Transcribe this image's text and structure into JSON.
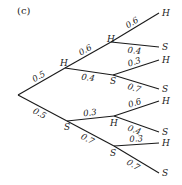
{
  "caption": "(c)",
  "tree": {
    "root": {
      "children": [
        {
          "label": "H",
          "prob": "0.5",
          "children": [
            {
              "label": "H",
              "prob": "0.6",
              "children": [
                {
                  "label": "H",
                  "prob": "0.6"
                },
                {
                  "label": "S",
                  "prob": "0.4"
                }
              ]
            },
            {
              "label": "S",
              "prob": "0.4",
              "children": [
                {
                  "label": "H",
                  "prob": "0.3"
                },
                {
                  "label": "S",
                  "prob": "0.7"
                }
              ]
            }
          ]
        },
        {
          "label": "S",
          "prob": "0.5",
          "children": [
            {
              "label": "H",
              "prob": "0.3",
              "children": [
                {
                  "label": "H",
                  "prob": "0.6"
                },
                {
                  "label": "S",
                  "prob": "0.4"
                }
              ]
            },
            {
              "label": "S",
              "prob": "0.7",
              "children": [
                {
                  "label": "H",
                  "prob": "0.3"
                },
                {
                  "label": "S",
                  "prob": "0.7"
                }
              ]
            }
          ]
        }
      ]
    }
  }
}
